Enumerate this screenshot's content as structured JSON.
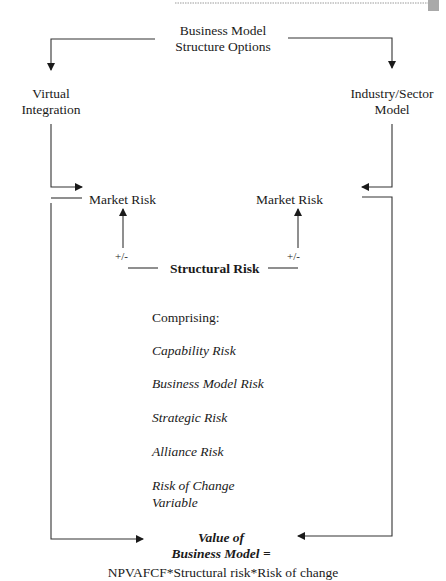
{
  "diagram": {
    "top": {
      "title_line1": "Business Model",
      "title_line2": "Structure Options"
    },
    "left_branch": {
      "line1": "Virtual",
      "line2": "Integration"
    },
    "right_branch": {
      "line1": "Industry/Sector",
      "line2": "Model"
    },
    "market_risk_left": "Market Risk",
    "market_risk_right": "Market Risk",
    "plus_minus_left": "+/-",
    "plus_minus_right": "+/-",
    "structural_risk": "Structural Risk",
    "comprising_label": "Comprising:",
    "components": [
      "Capability Risk",
      "Business Model Risk",
      "Strategic Risk",
      "Alliance Risk",
      "Risk of Change",
      "Variable"
    ],
    "value": {
      "line1": "Value of",
      "line2": "Business Model =",
      "formula": "NPVAFCF*Structural risk*Risk of change"
    },
    "colors": {
      "line": "#333333",
      "text": "#1a1a1a",
      "header_rule": "#9a9a9a",
      "corner_block": "#a9a9a9"
    }
  }
}
